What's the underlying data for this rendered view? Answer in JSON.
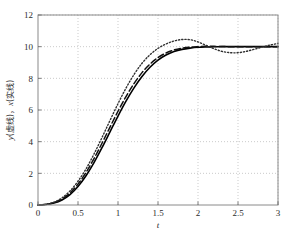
{
  "chart_data": {
    "type": "line",
    "title": "",
    "subtitle": "",
    "xlabel": "t",
    "ylabel": "y(虚线), x(实线)",
    "ylabel_parts": {
      "y_sym": "y",
      "y_note": "(虚线)",
      "sep": "，",
      "x_sym": "x",
      "x_note": "(实线)"
    },
    "xlim": [
      0,
      3
    ],
    "ylim": [
      0,
      12
    ],
    "xticks": [
      0,
      0.5,
      1,
      1.5,
      2,
      2.5,
      3
    ],
    "xticklabels": [
      "0",
      "0.5",
      "1",
      "1.5",
      "2",
      "2.5",
      "3"
    ],
    "yticks": [
      0,
      2,
      4,
      6,
      8,
      10,
      12
    ],
    "yticklabels": [
      "0",
      "2",
      "4",
      "6",
      "8",
      "10",
      "12"
    ],
    "grid": true,
    "grid_style": "dotted",
    "grid_color": "#b4b4b4",
    "axis_color": "#888888",
    "legend": "none",
    "steady_state": 10,
    "x": [
      0,
      0.1,
      0.2,
      0.3,
      0.4,
      0.5,
      0.6,
      0.7,
      0.8,
      0.9,
      1.0,
      1.1,
      1.2,
      1.3,
      1.4,
      1.5,
      1.6,
      1.7,
      1.8,
      1.9,
      2.0,
      2.1,
      2.2,
      2.3,
      2.4,
      2.5,
      2.6,
      2.7,
      2.8,
      2.9,
      3.0
    ],
    "series": [
      {
        "name": "x (solid)",
        "style": "solid",
        "color": "#000000",
        "width": 1.6,
        "values": [
          0.0,
          0.03,
          0.12,
          0.32,
          0.66,
          1.17,
          1.85,
          2.68,
          3.62,
          4.62,
          5.62,
          6.56,
          7.4,
          8.12,
          8.7,
          9.15,
          9.47,
          9.69,
          9.83,
          9.91,
          9.96,
          9.98,
          9.99,
          10.0,
          10.0,
          10.0,
          10.0,
          10.0,
          10.0,
          10.0,
          10.0
        ]
      },
      {
        "name": "y (dashed)",
        "style": "dashed",
        "color": "#111111",
        "width": 1.5,
        "values": [
          0.0,
          0.04,
          0.15,
          0.38,
          0.76,
          1.32,
          2.05,
          2.93,
          3.9,
          4.92,
          5.92,
          6.85,
          7.67,
          8.36,
          8.9,
          9.31,
          9.6,
          9.79,
          9.91,
          9.97,
          10.0,
          10.02,
          10.02,
          10.01,
          10.0,
          10.0,
          10.0,
          10.0,
          10.0,
          10.0,
          10.0
        ]
      },
      {
        "name": "dotted",
        "style": "dotted",
        "color": "#303030",
        "width": 1.4,
        "values": [
          0.0,
          0.05,
          0.18,
          0.45,
          0.89,
          1.5,
          2.28,
          3.22,
          4.26,
          5.34,
          6.4,
          7.38,
          8.24,
          8.95,
          9.49,
          9.89,
          10.17,
          10.36,
          10.45,
          10.44,
          10.3,
          10.08,
          9.87,
          9.7,
          9.62,
          9.62,
          9.7,
          9.83,
          9.97,
          10.1,
          10.2
        ]
      }
    ]
  },
  "figure": {
    "background": "#ffffff",
    "plot_background": "#ffffff"
  }
}
